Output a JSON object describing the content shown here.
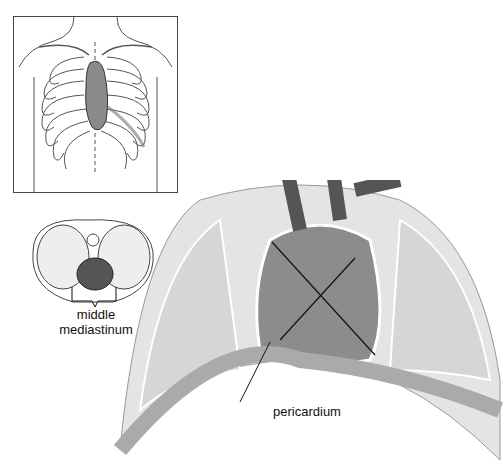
{
  "figure": {
    "labels": {
      "middle_line1": "middle",
      "middle_line2": "mediastinum",
      "pericardium": "pericardium"
    },
    "panels": {
      "inset_chest": "anterior chest wall with ribcage and heart",
      "inset_cross_section": "transverse section of thorax",
      "main": "opened thorax showing heart within pericardium"
    },
    "colors": {
      "line": "#333333",
      "fill_light": "#e6e6e6",
      "fill_mid": "#bdbdbd",
      "fill_dark": "#3a3a3a"
    }
  }
}
